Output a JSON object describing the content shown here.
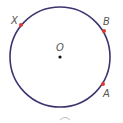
{
  "diagram": {
    "type": "circle",
    "circle": {
      "cx": 60,
      "cy": 57,
      "r": 50,
      "stroke": "#3b3670",
      "stroke_width": 1.6
    },
    "center": {
      "label": "O",
      "x": 60,
      "y": 57,
      "color": "#111111"
    },
    "points": [
      {
        "label": "X",
        "x": 21,
        "y": 25,
        "color": "#e03a2f"
      },
      {
        "label": "B",
        "x": 104,
        "y": 31,
        "color": "#e03a2f"
      },
      {
        "label": "A",
        "x": 103,
        "y": 84,
        "color": "#e03a2f"
      }
    ],
    "labels": {
      "X": "X",
      "B": "B",
      "A": "A",
      "O": "O"
    }
  }
}
